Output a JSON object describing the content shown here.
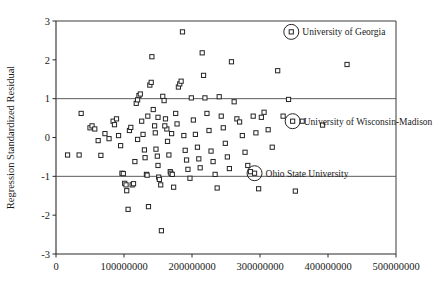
{
  "chart_data": {
    "type": "scatter",
    "title": "",
    "xlabel": "",
    "ylabel": "Regression Standardized Residual",
    "xlim": [
      0,
      500000000
    ],
    "ylim": [
      -3,
      3
    ],
    "xticks": [
      0,
      100000000,
      200000000,
      300000000,
      400000000,
      500000000
    ],
    "xtick_labels": [
      "0",
      "100000000",
      "200000000",
      "300000000",
      "400000000",
      "500000000"
    ],
    "yticks": [
      -3,
      -2,
      -1,
      0,
      1,
      2,
      3
    ],
    "ytick_labels": [
      "-3",
      "-2",
      "-1",
      "0",
      "1",
      "2",
      "3"
    ],
    "grid": false,
    "reference_lines": [
      {
        "axis": "y",
        "value": 1
      },
      {
        "axis": "y",
        "value": -1
      }
    ],
    "legend": "none",
    "marker": "open-square",
    "points": [
      {
        "x": 17000000,
        "y": -0.45
      },
      {
        "x": 34000000,
        "y": -0.45
      },
      {
        "x": 37000000,
        "y": 0.62
      },
      {
        "x": 50000000,
        "y": 0.25
      },
      {
        "x": 53000000,
        "y": 0.3
      },
      {
        "x": 57000000,
        "y": 0.22
      },
      {
        "x": 62000000,
        "y": -0.08
      },
      {
        "x": 66000000,
        "y": -0.46
      },
      {
        "x": 72000000,
        "y": 0.1
      },
      {
        "x": 78000000,
        "y": -0.03
      },
      {
        "x": 84000000,
        "y": 0.42
      },
      {
        "x": 86000000,
        "y": 0.33
      },
      {
        "x": 89000000,
        "y": 0.48
      },
      {
        "x": 92000000,
        "y": 0.05
      },
      {
        "x": 95000000,
        "y": -0.21
      },
      {
        "x": 97000000,
        "y": -0.92
      },
      {
        "x": 99000000,
        "y": -0.93
      },
      {
        "x": 101000000,
        "y": -1.18
      },
      {
        "x": 103000000,
        "y": -1.22
      },
      {
        "x": 104000000,
        "y": -1.37
      },
      {
        "x": 106000000,
        "y": -1.85
      },
      {
        "x": 108000000,
        "y": 0.18
      },
      {
        "x": 110000000,
        "y": 0.26
      },
      {
        "x": 112000000,
        "y": -1.22
      },
      {
        "x": 114000000,
        "y": -1.19
      },
      {
        "x": 116000000,
        "y": -0.62
      },
      {
        "x": 118000000,
        "y": 0.88
      },
      {
        "x": 120000000,
        "y": 0.97
      },
      {
        "x": 122000000,
        "y": 1.08
      },
      {
        "x": 124000000,
        "y": 1.12
      },
      {
        "x": 126000000,
        "y": 0.42
      },
      {
        "x": 128000000,
        "y": 0.08
      },
      {
        "x": 130000000,
        "y": -0.32
      },
      {
        "x": 131000000,
        "y": -0.52
      },
      {
        "x": 133000000,
        "y": -0.95
      },
      {
        "x": 134000000,
        "y": -0.97
      },
      {
        "x": 136000000,
        "y": -1.78
      },
      {
        "x": 138000000,
        "y": 1.35
      },
      {
        "x": 140000000,
        "y": 1.42
      },
      {
        "x": 141000000,
        "y": 2.08
      },
      {
        "x": 143000000,
        "y": 0.72
      },
      {
        "x": 145000000,
        "y": 0.3
      },
      {
        "x": 146000000,
        "y": 0.12
      },
      {
        "x": 147000000,
        "y": -0.3
      },
      {
        "x": 149000000,
        "y": -0.48
      },
      {
        "x": 150000000,
        "y": -0.72
      },
      {
        "x": 151000000,
        "y": -1.02
      },
      {
        "x": 152000000,
        "y": -1.08
      },
      {
        "x": 154000000,
        "y": -1.22
      },
      {
        "x": 155000000,
        "y": -2.4
      },
      {
        "x": 157000000,
        "y": 1.06
      },
      {
        "x": 159000000,
        "y": 0.95
      },
      {
        "x": 161000000,
        "y": 0.48
      },
      {
        "x": 163000000,
        "y": 0.22
      },
      {
        "x": 164000000,
        "y": -0.1
      },
      {
        "x": 166000000,
        "y": -0.45
      },
      {
        "x": 168000000,
        "y": -0.88
      },
      {
        "x": 169000000,
        "y": -0.92
      },
      {
        "x": 171000000,
        "y": -0.95
      },
      {
        "x": 173000000,
        "y": -1.28
      },
      {
        "x": 176000000,
        "y": 0.62
      },
      {
        "x": 178000000,
        "y": 0.35
      },
      {
        "x": 180000000,
        "y": 1.3
      },
      {
        "x": 182000000,
        "y": 1.38
      },
      {
        "x": 184000000,
        "y": 1.45
      },
      {
        "x": 186000000,
        "y": 2.72
      },
      {
        "x": 188000000,
        "y": 0.05
      },
      {
        "x": 190000000,
        "y": -0.33
      },
      {
        "x": 192000000,
        "y": -0.58
      },
      {
        "x": 194000000,
        "y": -0.82
      },
      {
        "x": 197000000,
        "y": -1.05
      },
      {
        "x": 199000000,
        "y": 1.02
      },
      {
        "x": 202000000,
        "y": 0.45
      },
      {
        "x": 205000000,
        "y": 0.08
      },
      {
        "x": 208000000,
        "y": -0.25
      },
      {
        "x": 210000000,
        "y": -0.55
      },
      {
        "x": 212000000,
        "y": -0.78
      },
      {
        "x": 215000000,
        "y": 2.18
      },
      {
        "x": 217000000,
        "y": 1.6
      },
      {
        "x": 219000000,
        "y": 1.02
      },
      {
        "x": 222000000,
        "y": 0.62
      },
      {
        "x": 225000000,
        "y": 0.18
      },
      {
        "x": 228000000,
        "y": -0.35
      },
      {
        "x": 231000000,
        "y": -0.62
      },
      {
        "x": 234000000,
        "y": -0.95
      },
      {
        "x": 237000000,
        "y": -1.3
      },
      {
        "x": 240000000,
        "y": 1.05
      },
      {
        "x": 243000000,
        "y": 0.55
      },
      {
        "x": 246000000,
        "y": 0.25
      },
      {
        "x": 249000000,
        "y": -0.15
      },
      {
        "x": 252000000,
        "y": -0.5
      },
      {
        "x": 255000000,
        "y": -0.8
      },
      {
        "x": 258000000,
        "y": 1.95
      },
      {
        "x": 262000000,
        "y": 0.92
      },
      {
        "x": 266000000,
        "y": 0.48
      },
      {
        "x": 270000000,
        "y": 0.4
      },
      {
        "x": 274000000,
        "y": 0.05
      },
      {
        "x": 278000000,
        "y": -0.38
      },
      {
        "x": 282000000,
        "y": -0.72
      },
      {
        "x": 286000000,
        "y": -0.88
      },
      {
        "x": 290000000,
        "y": 0.55
      },
      {
        "x": 294000000,
        "y": 0.12
      },
      {
        "x": 298000000,
        "y": -1.32
      },
      {
        "x": 302000000,
        "y": 0.52
      },
      {
        "x": 306000000,
        "y": 0.65
      },
      {
        "x": 312000000,
        "y": 0.2
      },
      {
        "x": 318000000,
        "y": -0.25
      },
      {
        "x": 326000000,
        "y": 1.72
      },
      {
        "x": 334000000,
        "y": 0.55
      },
      {
        "x": 342000000,
        "y": 0.98
      },
      {
        "x": 352000000,
        "y": -1.38
      },
      {
        "x": 362000000,
        "y": 0.42
      },
      {
        "x": 392000000,
        "y": 0.32
      },
      {
        "x": 428000000,
        "y": 1.88
      },
      {
        "x": 150000000,
        "y": 0.52
      },
      {
        "x": 160000000,
        "y": 0.3
      },
      {
        "x": 135000000,
        "y": 0.55
      },
      {
        "x": 120000000,
        "y": -0.05
      },
      {
        "x": 170000000,
        "y": 0.1
      }
    ],
    "annotations": [
      {
        "label": "University of Georgia",
        "x": 346000000,
        "y": 2.72,
        "ring": true
      },
      {
        "label": "University of Wisconsin-Madison",
        "x": 348000000,
        "y": 0.42,
        "ring": true
      },
      {
        "label": "Ohio State University",
        "x": 292000000,
        "y": -0.92,
        "ring": true
      }
    ]
  }
}
